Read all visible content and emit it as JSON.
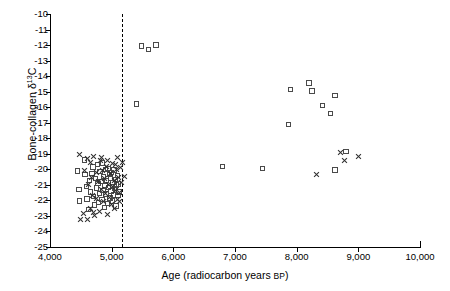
{
  "chart_data": {
    "type": "scatter",
    "title": "",
    "xlabel": "Age (radiocarbon years BP)",
    "ylabel": "Bone-collagen δ¹³C",
    "ylabel_main": "Bone-collagen δ",
    "ylabel_sup": "13",
    "ylabel_tail": "C",
    "xlabel_main": "Age (radiocarbon years ",
    "xlabel_bp": "BP",
    "xlabel_end": ")",
    "xlim": [
      4000,
      10000
    ],
    "ylim": [
      -25,
      -10
    ],
    "grid": false,
    "legend": null,
    "xticks": [
      4000,
      5000,
      6000,
      7000,
      8000,
      9000,
      10000
    ],
    "xticklabels": [
      "4,000",
      "5,000",
      "6,000",
      "7,000",
      "8,000",
      "9,000",
      "10,000"
    ],
    "yticks": [
      -10,
      -11,
      -12,
      -13,
      -14,
      -15,
      -16,
      -17,
      -18,
      -19,
      -20,
      -21,
      -22,
      -23,
      -24,
      -25
    ],
    "yticklabels": [
      "-10",
      "-11",
      "-12",
      "-13",
      "-14",
      "-15",
      "-16",
      "-17",
      "-18",
      "-19",
      "-20",
      "-21",
      "-22",
      "-23",
      "-24",
      "-25"
    ],
    "annotations": [
      {
        "type": "vline",
        "name": "dashed-divider",
        "x": 5170,
        "style": "dashed",
        "color": "#000000"
      }
    ],
    "series": [
      {
        "name": "square-marker-series",
        "marker": "square",
        "color": "#4a4a4a",
        "points": [
          [
            5480,
            -12.05
          ],
          [
            5600,
            -12.3
          ],
          [
            5720,
            -12.0
          ],
          [
            5400,
            -15.8
          ],
          [
            6800,
            -19.8
          ],
          [
            7450,
            -19.95
          ],
          [
            7900,
            -14.85
          ],
          [
            8200,
            -14.45
          ],
          [
            8250,
            -14.95
          ],
          [
            7870,
            -17.1
          ],
          [
            8420,
            -15.9
          ],
          [
            8550,
            -16.4
          ],
          [
            8620,
            -15.25
          ],
          [
            8800,
            -18.85
          ],
          [
            8620,
            -20.05
          ],
          [
            4450,
            -20.1
          ],
          [
            4470,
            -21.3
          ],
          [
            4480,
            -22.05
          ],
          [
            4560,
            -19.4
          ],
          [
            4570,
            -20.35
          ],
          [
            4590,
            -21.1
          ],
          [
            4600,
            -21.9
          ],
          [
            4620,
            -22.6
          ],
          [
            4640,
            -20.7
          ],
          [
            4660,
            -21.45
          ],
          [
            4680,
            -20.25
          ],
          [
            4700,
            -19.85
          ],
          [
            4710,
            -21.75
          ],
          [
            4720,
            -22.3
          ],
          [
            4740,
            -20.6
          ],
          [
            4750,
            -21.2
          ],
          [
            4770,
            -19.7
          ],
          [
            4780,
            -20.9
          ],
          [
            4790,
            -22.15
          ],
          [
            4800,
            -21.55
          ],
          [
            4810,
            -20.15
          ],
          [
            4830,
            -20.8
          ],
          [
            4840,
            -21.95
          ],
          [
            4850,
            -19.6
          ],
          [
            4860,
            -21.35
          ],
          [
            4870,
            -20.45
          ],
          [
            4880,
            -22.45
          ],
          [
            4890,
            -21.05
          ],
          [
            4900,
            -20.0
          ],
          [
            4910,
            -21.6
          ],
          [
            4920,
            -20.7
          ],
          [
            4930,
            -22.2
          ],
          [
            4940,
            -19.95
          ],
          [
            4950,
            -21.15
          ],
          [
            4960,
            -20.35
          ],
          [
            4970,
            -21.85
          ],
          [
            4980,
            -20.55
          ],
          [
            4990,
            -21.4
          ],
          [
            5000,
            -20.2
          ],
          [
            5010,
            -22.05
          ],
          [
            5020,
            -20.85
          ],
          [
            5030,
            -21.65
          ],
          [
            5040,
            -20.05
          ],
          [
            5050,
            -21.25
          ],
          [
            5060,
            -20.65
          ],
          [
            5070,
            -22.35
          ],
          [
            5080,
            -21.0
          ],
          [
            5090,
            -20.4
          ],
          [
            5100,
            -21.7
          ],
          [
            5110,
            -20.95
          ],
          [
            5120,
            -21.45
          ]
        ]
      },
      {
        "name": "cross-marker-series",
        "marker": "cross",
        "color": "#2e2e2e",
        "points": [
          [
            8710,
            -18.9
          ],
          [
            9010,
            -19.15
          ],
          [
            8780,
            -19.45
          ],
          [
            8320,
            -20.35
          ],
          [
            4480,
            -19.05
          ],
          [
            4500,
            -23.2
          ],
          [
            4540,
            -22.85
          ],
          [
            4560,
            -20.05
          ],
          [
            4600,
            -19.3
          ],
          [
            4620,
            -21.0
          ],
          [
            4650,
            -22.5
          ],
          [
            4670,
            -20.5
          ],
          [
            4690,
            -21.7
          ],
          [
            4700,
            -19.15
          ],
          [
            4720,
            -23.0
          ],
          [
            4750,
            -20.2
          ],
          [
            4760,
            -21.9
          ],
          [
            4780,
            -20.8
          ],
          [
            4800,
            -22.7
          ],
          [
            4820,
            -19.45
          ],
          [
            4840,
            -21.3
          ],
          [
            4850,
            -20.1
          ],
          [
            4870,
            -22.1
          ],
          [
            4890,
            -20.6
          ],
          [
            4900,
            -21.55
          ],
          [
            4920,
            -19.8
          ],
          [
            4930,
            -22.9
          ],
          [
            4950,
            -20.95
          ],
          [
            4960,
            -21.8
          ],
          [
            4980,
            -20.3
          ],
          [
            5000,
            -22.25
          ],
          [
            5010,
            -19.6
          ],
          [
            5020,
            -21.1
          ],
          [
            5040,
            -20.75
          ],
          [
            5050,
            -22.55
          ],
          [
            5070,
            -21.35
          ],
          [
            5080,
            -20.0
          ],
          [
            5090,
            -21.95
          ],
          [
            5100,
            -19.25
          ],
          [
            5110,
            -20.55
          ],
          [
            5130,
            -21.5
          ],
          [
            5150,
            -19.9
          ],
          [
            5160,
            -20.85
          ],
          [
            5180,
            -19.55
          ],
          [
            5200,
            -20.45
          ],
          [
            4610,
            -23.25
          ],
          [
            4700,
            -22.75
          ],
          [
            4660,
            -19.55
          ],
          [
            4840,
            -19.25
          ],
          [
            5120,
            -22.05
          ],
          [
            4930,
            -19.4
          ],
          [
            5060,
            -19.7
          ]
        ]
      }
    ]
  }
}
